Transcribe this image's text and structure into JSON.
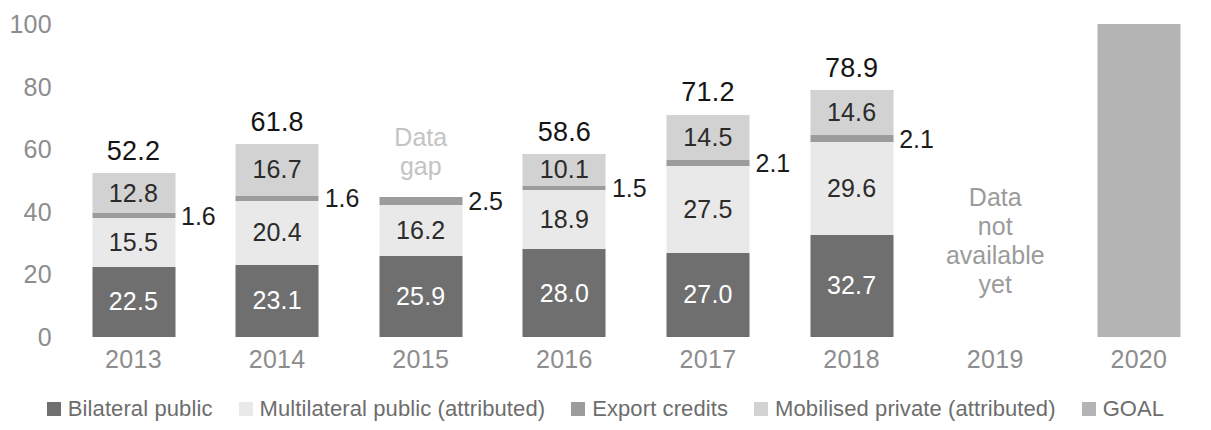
{
  "chart_data": {
    "type": "bar",
    "title": "",
    "subtitle": "",
    "xlabel": "",
    "ylabel": "",
    "ylim": [
      0,
      100
    ],
    "yticks": [
      0,
      20,
      40,
      60,
      80,
      100
    ],
    "grid": false,
    "stacked": true,
    "legend_position": "bottom",
    "categories": [
      "2013",
      "2014",
      "2015",
      "2016",
      "2017",
      "2018",
      "2019",
      "2020"
    ],
    "series": [
      {
        "name": "Bilateral public",
        "color": "#6f6f6f",
        "values": [
          22.5,
          23.1,
          25.9,
          28.0,
          27.0,
          32.7,
          null,
          null
        ],
        "labels": [
          "22.5",
          "23.1",
          "25.9",
          "28.0",
          "27.0",
          "32.7",
          "",
          ""
        ]
      },
      {
        "name": "Multilateral public (attributed)",
        "color": "#e9e9e9",
        "values": [
          15.5,
          20.4,
          16.2,
          18.9,
          27.5,
          29.6,
          null,
          null
        ],
        "labels": [
          "15.5",
          "20.4",
          "16.2",
          "18.9",
          "27.5",
          "29.6",
          "",
          ""
        ]
      },
      {
        "name": "Export credits",
        "color": "#9c9c9c",
        "values": [
          1.6,
          1.6,
          2.5,
          1.5,
          2.1,
          2.1,
          null,
          null
        ],
        "labels": [
          "1.6",
          "1.6",
          "2.5",
          "1.5",
          "2.1",
          "2.1",
          "",
          ""
        ]
      },
      {
        "name": "Mobilised private (attributed)",
        "color": "#d2d2d2",
        "values": [
          12.8,
          16.7,
          null,
          10.1,
          14.5,
          14.6,
          null,
          null
        ],
        "labels": [
          "12.8",
          "16.7",
          "",
          "10.1",
          "14.5",
          "14.6",
          "",
          ""
        ]
      },
      {
        "name": "GOAL",
        "color": "#b4b4b4",
        "values": [
          null,
          null,
          null,
          null,
          null,
          null,
          null,
          100
        ],
        "labels": [
          "",
          "",
          "",
          "",
          "",
          "",
          "",
          ""
        ]
      }
    ],
    "totals": [
      "52.2",
      "61.8",
      "",
      "58.6",
      "71.2",
      "78.9",
      "",
      ""
    ],
    "annotations": [
      {
        "category": "2015",
        "text": "Data\ngap"
      },
      {
        "category": "2019",
        "text": "Data\nnot\navailable\nyet"
      }
    ]
  },
  "axis": {
    "y_ticks": [
      "100",
      "80",
      "60",
      "40",
      "20",
      "0"
    ],
    "x_ticks": [
      "2013",
      "2014",
      "2015",
      "2016",
      "2017",
      "2018",
      "2019",
      "2020"
    ]
  },
  "legend": {
    "items": [
      {
        "label": "Bilateral public",
        "color": "#6f6f6f"
      },
      {
        "label": "Multilateral public (attributed)",
        "color": "#e9e9e9"
      },
      {
        "label": "Export credits",
        "color": "#9c9c9c"
      },
      {
        "label": "Mobilised private (attributed)",
        "color": "#d2d2d2"
      },
      {
        "label": "GOAL",
        "color": "#b4b4b4"
      }
    ]
  },
  "notes": {
    "data_gap": "Data\ngap",
    "data_not_available": "Data\nnot\navailable\nyet"
  }
}
